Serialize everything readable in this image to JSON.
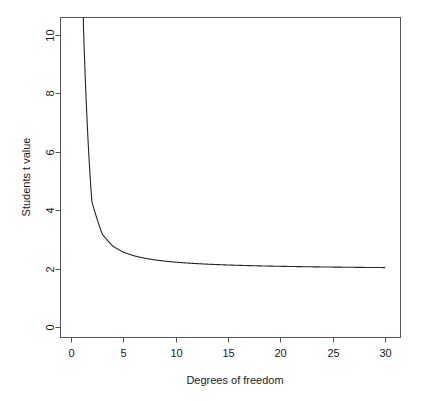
{
  "chart_data": {
    "type": "line",
    "title": "",
    "xlabel": "Degrees of freedom",
    "ylabel": "Students  t value",
    "xlim": [
      -1,
      31.5
    ],
    "ylim": [
      -0.35,
      10.6
    ],
    "xticks": [
      0,
      5,
      10,
      15,
      20,
      25,
      30
    ],
    "xticklabels": [
      "0",
      "5",
      "10",
      "15",
      "20",
      "25",
      "30"
    ],
    "yticks": [
      0,
      2,
      4,
      6,
      8,
      10
    ],
    "yticklabels": [
      "0",
      "2",
      "4",
      "6",
      "8",
      "10"
    ],
    "grid": false,
    "legend": false,
    "legend_position": "none",
    "line_color": "#262626",
    "line_width": 1,
    "background": "#ffffff",
    "frame": true,
    "series": [
      {
        "name": "Student's t critical value (two-tailed, alpha = 0.05)",
        "x": [
          1,
          2,
          3,
          4,
          5,
          6,
          7,
          8,
          9,
          10,
          11,
          12,
          13,
          14,
          15,
          16,
          17,
          18,
          19,
          20,
          21,
          22,
          23,
          24,
          25,
          26,
          27,
          28,
          29,
          30
        ],
        "values": [
          12.706,
          4.303,
          3.182,
          2.776,
          2.571,
          2.447,
          2.365,
          2.306,
          2.262,
          2.228,
          2.201,
          2.179,
          2.16,
          2.145,
          2.131,
          2.12,
          2.11,
          2.101,
          2.093,
          2.086,
          2.08,
          2.074,
          2.069,
          2.064,
          2.06,
          2.056,
          2.052,
          2.048,
          2.045,
          2.042
        ]
      }
    ]
  },
  "axes": {
    "x_axis_name": "Degrees of freedom",
    "y_axis_name": "Students  t value"
  }
}
